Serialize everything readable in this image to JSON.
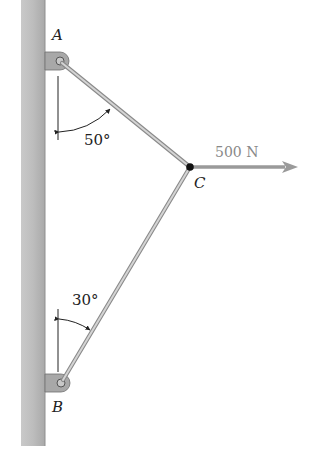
{
  "diagram": {
    "type": "statics-two-member-bracket",
    "points": {
      "A": {
        "label": "A",
        "x": 60,
        "y": 61
      },
      "B": {
        "label": "B",
        "x": 61,
        "y": 383
      },
      "C": {
        "label": "C",
        "x": 190,
        "y": 167
      }
    },
    "angles": [
      {
        "label": "50°",
        "at": "A",
        "from": "vertical",
        "to": "member AC"
      },
      {
        "label": "30°",
        "at": "B",
        "from": "vertical",
        "to": "member BC"
      }
    ],
    "force": {
      "label": "500 N",
      "at": "C",
      "direction": "horizontal-right",
      "color": "#999999"
    },
    "members": [
      "AC",
      "BC"
    ],
    "wall": {
      "side": "left",
      "color": "#b8b8b8"
    }
  }
}
